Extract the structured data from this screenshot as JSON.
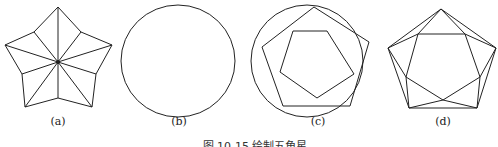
{
  "figure": {
    "panels": [
      {
        "id": "a",
        "label": "(a)",
        "description": "Five-pointed star divided into triangles from center"
      },
      {
        "id": "b",
        "label": "(b)",
        "description": "Circle"
      },
      {
        "id": "c",
        "label": "(c)",
        "description": "Circle with inscribed pentagon and inner rotated pentagon"
      },
      {
        "id": "d",
        "label": "(d)",
        "description": "Pentagon with inner pentagon and connecting triangles"
      }
    ],
    "caption": "图 10-15 绘制五角星"
  }
}
